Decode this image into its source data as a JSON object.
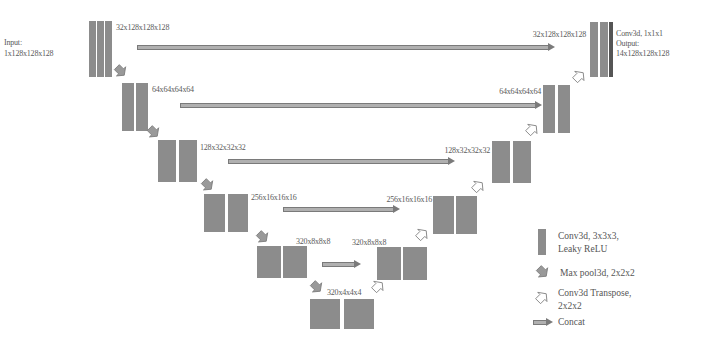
{
  "diagram": {
    "type": "3D U-Net architecture",
    "input_label": [
      "Input:",
      "1x128x128x128"
    ],
    "output_label": [
      "Conv3d, 1x1x1",
      "Output:",
      "14x128x128x128"
    ],
    "encoder": [
      {
        "level": 0,
        "label": "32x128x128x128"
      },
      {
        "level": 1,
        "label": "64x64x64x64"
      },
      {
        "level": 2,
        "label": "128x32x32x32"
      },
      {
        "level": 3,
        "label": "256x16x16x16"
      },
      {
        "level": 4,
        "label": "320x8x8x8"
      }
    ],
    "bottleneck": {
      "label": "320x4x4x4"
    },
    "decoder": [
      {
        "level": 0,
        "label": "32x128x128x128"
      },
      {
        "level": 1,
        "label": "64x64x64x64"
      },
      {
        "level": 2,
        "label": "128x32x32x32"
      },
      {
        "level": 3,
        "label": "256x16x16x16"
      },
      {
        "level": 4,
        "label": "320x8x8x8"
      }
    ]
  },
  "legend": {
    "items": [
      {
        "icon": "conv-block-icon",
        "lines": [
          "Conv3d, 3x3x3,",
          "Leaky ReLU"
        ]
      },
      {
        "icon": "max-pool-arrow-icon",
        "lines": [
          "Max pool3d, 2x2x2"
        ]
      },
      {
        "icon": "conv-transpose-arrow-icon",
        "lines": [
          "Conv3d Transpose,",
          "2x2x2"
        ]
      },
      {
        "icon": "concat-arrow-icon",
        "lines": [
          "Concat"
        ]
      }
    ]
  },
  "colors": {
    "block": "#8c8c8c",
    "output_block": "#555555",
    "arrow": "#7a7a7a",
    "background": "#ffffff"
  }
}
